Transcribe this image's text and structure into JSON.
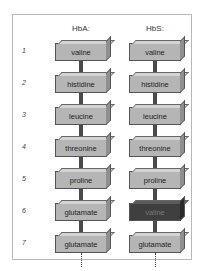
{
  "columns": [
    {
      "header": "HbA:",
      "residues": [
        "valine",
        "histidine",
        "leucine",
        "threonine",
        "proline",
        "glutamate",
        "glutamate"
      ]
    },
    {
      "header": "HbS:",
      "residues": [
        "valine",
        "histidine",
        "leucine",
        "threonine",
        "proline",
        "valine",
        "glutamate"
      ]
    }
  ],
  "positions": [
    "1",
    "2",
    "3",
    "4",
    "5",
    "6",
    "7"
  ],
  "highlight": {
    "column": 1,
    "position": 6,
    "color": "#3f3f3f"
  }
}
